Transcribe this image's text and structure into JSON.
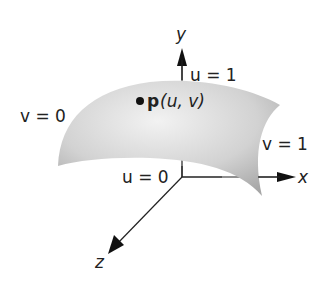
{
  "diagram": {
    "axes": {
      "x_label": "x",
      "y_label": "y",
      "z_label": "z"
    },
    "boundary_labels": {
      "u0": "u = 0",
      "u1": "u = 1",
      "v0": "v = 0",
      "v1": "v = 1"
    },
    "point": {
      "name": "p",
      "args": "(u, v)"
    },
    "colors": {
      "surface_light": "#ececec",
      "surface_dark": "#a8a8a8",
      "axis": "#222222"
    }
  }
}
